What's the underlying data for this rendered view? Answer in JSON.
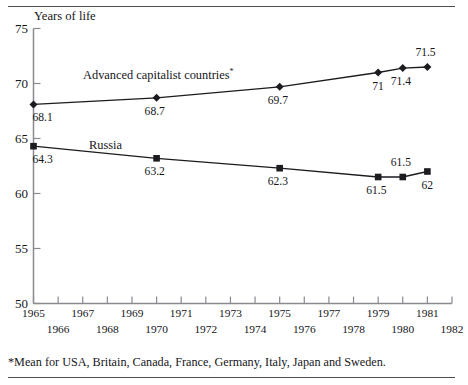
{
  "chart_data": {
    "type": "line",
    "title": "",
    "ylabel": "Years of life",
    "xlabel": "",
    "ylim": [
      50,
      75
    ],
    "ytick_values": [
      75,
      70,
      65,
      60,
      55,
      50
    ],
    "ytick_labels": [
      "75",
      "70",
      "65",
      "60",
      "55",
      "50"
    ],
    "xlim": [
      1965,
      1982
    ],
    "xtick_values": [
      1965,
      1966,
      1967,
      1968,
      1969,
      1970,
      1971,
      1972,
      1973,
      1974,
      1975,
      1976,
      1977,
      1978,
      1979,
      1980,
      1981,
      1982
    ],
    "xtick_labels_upper": [
      "1965",
      "1967",
      "1969",
      "1971",
      "1973",
      "1975",
      "1977",
      "1979",
      "1981"
    ],
    "xtick_labels_lower": [
      "1966",
      "1968",
      "1970",
      "1972",
      "1974",
      "1976",
      "1978",
      "1980",
      "1982"
    ],
    "grid": false,
    "legend_position": "inline-annotation",
    "x": [
      1965,
      1970,
      1975,
      1979,
      1980,
      1981
    ],
    "series": [
      {
        "name": "Advanced capitalist countries*",
        "marker": "diamond",
        "values": [
          68.1,
          68.7,
          69.7,
          71.0,
          71.4,
          71.5
        ],
        "point_labels": [
          "68.1",
          "68.7",
          "69.7",
          "71",
          "71.4",
          "71.5"
        ],
        "label_positions": [
          "below",
          "below",
          "below",
          "below",
          "below",
          "above"
        ]
      },
      {
        "name": "Russia",
        "marker": "square",
        "values": [
          64.3,
          63.2,
          62.3,
          61.5,
          61.5,
          62.0
        ],
        "point_labels": [
          "64.3",
          "63.2",
          "62.3",
          "61.5",
          "61.5",
          "62"
        ],
        "label_positions": [
          "below",
          "below",
          "below",
          "below",
          "above",
          "below"
        ]
      }
    ],
    "annotations": [
      {
        "text": "Advanced capitalist countries",
        "sup": "*"
      },
      {
        "text": "Russia",
        "sup": ""
      }
    ],
    "footnote": "*Mean for USA, Britain, Canada, France, Germany, Italy, Japan and Sweden.",
    "colors": {
      "line": "#1b1b20",
      "axis": "#8a8a90",
      "text": "#16161a",
      "rule": "#4c4c52",
      "background": "#ffffff"
    }
  }
}
